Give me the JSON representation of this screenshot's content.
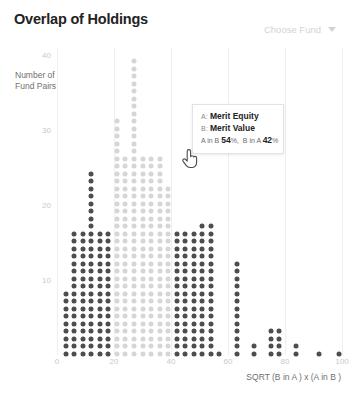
{
  "header": {
    "title": "Overlap of Holdings",
    "fund_selector_label": "Choose Fund",
    "fund_selector_icon": "chevron-down-icon"
  },
  "tooltip": {
    "a_key": "A:",
    "a_value": "Merit Equity",
    "b_key": "B:",
    "b_value": "Merit Value",
    "stat1_label": "A in B",
    "stat1_value": "54",
    "stat1_unit": "%,",
    "stat2_label": "B in A",
    "stat2_value": "42",
    "stat2_unit": "%",
    "cursor_icon": "hand-pointer-icon"
  },
  "colors": {
    "dot_dark": "#4d4d4d",
    "dot_light": "#d6d6d6",
    "gridline": "#efefef",
    "tick_text": "#c9c9c9",
    "axis_title": "#6f6f6f",
    "title_text": "#222222",
    "selector_text": "#d3d3d3",
    "background": "#ffffff"
  },
  "chart_data": {
    "type": "scatter",
    "title": "Overlap of Holdings",
    "xlabel": "SQRT (B in A ) x (A in B )",
    "ylabel": "Number of Fund Pairs",
    "xlim": [
      0,
      100
    ],
    "ylim": [
      0,
      41
    ],
    "xticks": [
      0,
      20,
      40,
      60,
      80,
      100
    ],
    "yticks": [
      10,
      20,
      30,
      40
    ],
    "grid": "vertical",
    "legend": "none",
    "note": "Dot-histogram: each column is an x bin; column value = stacked dot count (Number of Fund Pairs). Dark dots are highlighted/selected bins, light dots are unhighlighted.",
    "categories": [
      3,
      6,
      9,
      12,
      15,
      18,
      21,
      24,
      27,
      30,
      33,
      36,
      39,
      42,
      45,
      48,
      51,
      54,
      57,
      63,
      69,
      75,
      78,
      84,
      92,
      99
    ],
    "values": [
      9,
      17,
      17,
      25,
      17,
      17,
      32,
      27,
      40,
      27,
      27,
      27,
      23,
      17,
      17,
      17,
      18,
      18,
      1,
      13,
      2,
      4,
      4,
      2,
      1,
      1
    ],
    "shades": [
      "dark",
      "dark",
      "dark",
      "dark",
      "dark",
      "dark",
      "light",
      "light",
      "light",
      "light",
      "light",
      "light",
      "light",
      "dark",
      "dark",
      "dark",
      "dark",
      "dark",
      "dark",
      "dark",
      "dark",
      "dark",
      "dark",
      "dark",
      "dark",
      "dark"
    ]
  }
}
